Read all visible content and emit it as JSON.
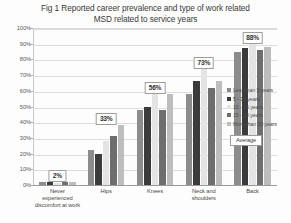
{
  "chart_data": {
    "type": "bar",
    "title": "Fig 1 Reported career prevalence and type of work related MSD related to service years",
    "title_line1": "Fig 1 Reported career prevalence and type of work related",
    "title_line2": "MSD related to service years",
    "xlabel": "",
    "ylabel": "",
    "ylim": [
      0,
      100
    ],
    "grid": true,
    "legend_position": "right",
    "categories": [
      "Never experienced discomfort at work",
      "Hips",
      "Knees",
      "Neck and shoulders",
      "Back"
    ],
    "ticks": [
      "0%",
      "10%",
      "20%",
      "30%",
      "40%",
      "50%",
      "60%",
      "70%",
      "80%",
      "90%",
      "100%"
    ],
    "series": [
      {
        "name": "Less than 5 years",
        "color": "#8c8c8c",
        "values": [
          2,
          22,
          48,
          58,
          85
        ]
      },
      {
        "name": "5 - 10 years",
        "color": "#3b3b3b",
        "values": [
          2,
          20,
          50,
          66,
          87
        ]
      },
      {
        "name": "10 - 15 years",
        "color": "#e4e4e4",
        "values": [
          1,
          28,
          58,
          74,
          90
        ]
      },
      {
        "name": "15 - 20 years",
        "color": "#6e6e6e",
        "values": [
          2,
          31,
          48,
          62,
          86
        ]
      },
      {
        "name": "More than 20 years",
        "color": "#bdbdbd",
        "values": [
          2,
          38,
          58,
          66,
          88
        ]
      }
    ],
    "average_labels": [
      "2%",
      "33%",
      "56%",
      "73%",
      "88%"
    ],
    "average_values": [
      2,
      33,
      56,
      73,
      88
    ],
    "average_legend_label": "Average"
  }
}
